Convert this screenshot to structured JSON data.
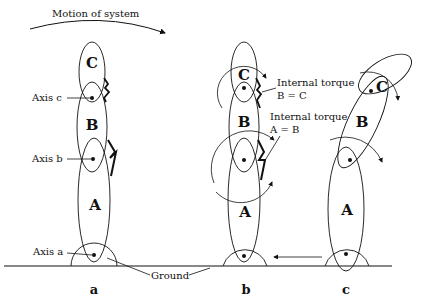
{
  "title": "Motion of system",
  "axis_labels": {
    "c": "Axis c",
    "b": "Axis b",
    "a": "Axis a"
  },
  "ground_label": "Ground",
  "segments": {
    "A": "A",
    "B": "B",
    "C": "C"
  },
  "torque_labels": {
    "bc_line1": "Internal torque",
    "bc_line2": "B = C",
    "ab_line1": "Internal torque",
    "ab_line2": "A = B"
  },
  "figure_labels": {
    "a": "a",
    "b": "b",
    "c": "c"
  },
  "colors": {
    "stroke": "#111111",
    "background": "#ffffff"
  }
}
